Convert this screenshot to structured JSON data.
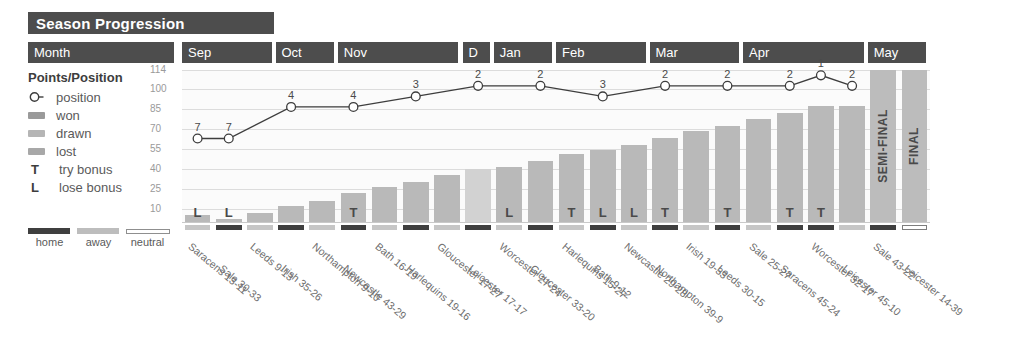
{
  "title": "Season Progression",
  "header": {
    "row_label": "Month",
    "months": [
      {
        "label": "Sep",
        "matches": 3
      },
      {
        "label": "Oct",
        "matches": 2
      },
      {
        "label": "Nov",
        "matches": 4
      },
      {
        "label": "D",
        "matches": 1
      },
      {
        "label": "Jan",
        "matches": 2
      },
      {
        "label": "Feb",
        "matches": 3
      },
      {
        "label": "Mar",
        "matches": 3
      },
      {
        "label": "Apr",
        "matches": 4
      },
      {
        "label": "May",
        "matches": 2
      }
    ]
  },
  "legend": {
    "title": "Points/Position",
    "items": [
      {
        "key": "position-marker",
        "label": "position"
      },
      {
        "key": "won-swatch",
        "label": "won"
      },
      {
        "key": "drawn-swatch",
        "label": "drawn"
      },
      {
        "key": "lost-swatch",
        "label": "lost"
      },
      {
        "key": "T",
        "label": "try bonus"
      },
      {
        "key": "L",
        "label": "lose bonus"
      }
    ],
    "venue": {
      "home": "home",
      "away": "away",
      "neutral": "neutral"
    }
  },
  "colors": {
    "header_bg": "#4d4d4d",
    "header_text": "#ffffff",
    "bar": "#b9b9b9",
    "bar_drawn": "#d2d2d2",
    "knockout_bar": "#bcbcbc",
    "home": "#3f3f3f",
    "away": "#c6c6c6",
    "neutral": "#ffffff",
    "line": "#3d3d3d",
    "grid": "#dcdcdc",
    "plot_bg": "#fbfbfb"
  },
  "chart_data": {
    "type": "bar",
    "title": "Season Progression",
    "xlabel": "",
    "ylabel": "Points/Position",
    "ylim": [
      0,
      114
    ],
    "yticks": [
      114,
      100,
      85,
      70,
      55,
      40,
      25,
      10
    ],
    "grid": true,
    "legend_position": "left",
    "categories": [
      "Saracens 13-11",
      "Sale 30-33",
      "Leeds 9-13",
      "Irish 35-26",
      "Northampton 9-10",
      "Newcastle 43-29",
      "Bath 16-19",
      "Harlequins 19-16",
      "Gloucester 17-27",
      "Leicester 17-17",
      "Worcester 27-24",
      "Gloucester 33-20",
      "Harlequins 15-27",
      "Bath 9-12",
      "Newcastle 29-28",
      "Northampton 39-9",
      "Irish 19-33",
      "Leeds 30-15",
      "Sale 25-27",
      "Saracens 45-24",
      "Worcester 32-17",
      "Leicester 45-10",
      "Sale 43-22",
      "Leicester 14-39"
    ],
    "series": [
      {
        "name": "cumulative points",
        "values": [
          5,
          2,
          7,
          12,
          16,
          22,
          26,
          30,
          35,
          40,
          41,
          46,
          51,
          54,
          58,
          63,
          68,
          72,
          77,
          82,
          87,
          87,
          null,
          null
        ]
      },
      {
        "name": "league position",
        "values": [
          7,
          7,
          null,
          4,
          null,
          4,
          null,
          3,
          null,
          2,
          null,
          2,
          null,
          3,
          null,
          2,
          null,
          2,
          null,
          2,
          1,
          2,
          null,
          null
        ]
      }
    ],
    "result": [
      "won",
      "lost",
      "lost",
      "won",
      "lost",
      "won",
      "lost",
      "won",
      "lost",
      "drawn",
      "won",
      "won",
      "lost",
      "lost",
      "won",
      "won",
      "lost",
      "won",
      "lost",
      "won",
      "won",
      "won",
      "won",
      "lost"
    ],
    "bonus": [
      "L",
      "L",
      "",
      "",
      "",
      "T",
      "",
      "",
      "",
      "",
      "L",
      "",
      "T",
      "L",
      "L",
      "T",
      "",
      "T",
      "",
      "T",
      "T",
      "",
      "",
      ""
    ],
    "venue": [
      "away",
      "home",
      "away",
      "home",
      "away",
      "home",
      "away",
      "home",
      "away",
      "home",
      "away",
      "home",
      "away",
      "home",
      "away",
      "home",
      "away",
      "home",
      "away",
      "home",
      "home",
      "away",
      "home",
      "neutral"
    ],
    "knockout": [
      {
        "index": 22,
        "label": "SEMI-FINAL"
      },
      {
        "index": 23,
        "label": "FINAL"
      }
    ]
  }
}
